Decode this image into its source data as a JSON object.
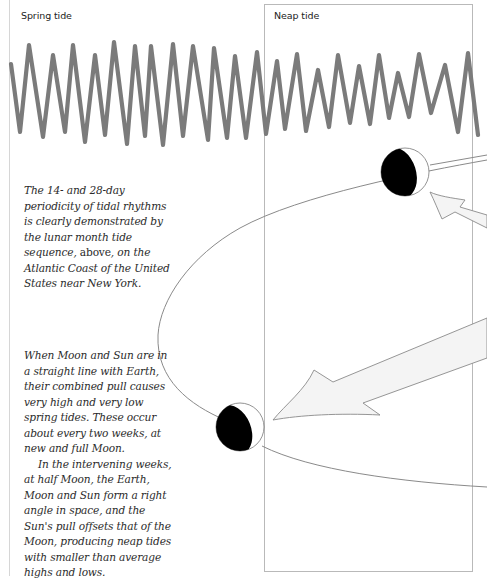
{
  "labels": {
    "spring_tide": "Spring tide",
    "neap_tide": "Neap tide"
  },
  "captions": {
    "periodicity": {
      "part1": "The 14- and 28-day periodicity of tidal rhythms is clearly demonstrated by the lunar month tide sequence, ",
      "emphasis": "above",
      "part2": ", on the Atlantic Coast of the United States near New York."
    },
    "spring_neap": {
      "paragraph1": "When Moon and Sun are in a straight line with Earth, their combined pull causes very high and very low spring tides. These occur about every two weeks, at new and full Moon.",
      "paragraph2": "In the intervening weeks, at half Moon, the Earth, Moon and Sun form a right angle in space, and the Sun's pull offsets that of the Moon, producing neap tides with smaller than average highs and lows."
    }
  },
  "colors": {
    "wave": "#7b7b7b",
    "box_border": "#b9b9b9",
    "orbit": "#8a8a8a",
    "moon_dark": "#000000",
    "arrow_fill": "#f4f4f4"
  },
  "chart_data": {
    "type": "line",
    "xlabel": "",
    "ylabel": "",
    "annotations": [
      "Spring tide",
      "Neap tide"
    ],
    "regions": [
      {
        "name": "Spring tide",
        "x_start": 0,
        "x_end": 0.52
      },
      {
        "name": "Neap tide",
        "x_start": 0.52,
        "x_end": 1.0
      }
    ],
    "grid": false,
    "points_px": [
      [
        11,
        64
      ],
      [
        20,
        132
      ],
      [
        29,
        45
      ],
      [
        43,
        137
      ],
      [
        53,
        55
      ],
      [
        65,
        132
      ],
      [
        73,
        45
      ],
      [
        85,
        142
      ],
      [
        95,
        55
      ],
      [
        105,
        135
      ],
      [
        114,
        42
      ],
      [
        127,
        144
      ],
      [
        135,
        46
      ],
      [
        145,
        136
      ],
      [
        151,
        46
      ],
      [
        163,
        145
      ],
      [
        173,
        44
      ],
      [
        183,
        136
      ],
      [
        193,
        46
      ],
      [
        208,
        140
      ],
      [
        214,
        48
      ],
      [
        227,
        138
      ],
      [
        235,
        56
      ],
      [
        246,
        138
      ],
      [
        257,
        52
      ],
      [
        266,
        134
      ],
      [
        277,
        61
      ],
      [
        285,
        129
      ],
      [
        297,
        54
      ],
      [
        306,
        131
      ],
      [
        318,
        70
      ],
      [
        329,
        127
      ],
      [
        338,
        55
      ],
      [
        350,
        123
      ],
      [
        359,
        66
      ],
      [
        370,
        124
      ],
      [
        379,
        55
      ],
      [
        389,
        118
      ],
      [
        398,
        73
      ],
      [
        409,
        117
      ],
      [
        419,
        54
      ],
      [
        431,
        113
      ],
      [
        445,
        65
      ],
      [
        458,
        132
      ],
      [
        468,
        53
      ],
      [
        478,
        135
      ]
    ],
    "tidal_range_relative": {
      "spring_peak_to_trough_px": [
        87,
        92,
        92,
        87,
        97,
        95,
        100,
        102,
        90,
        97,
        92,
        94,
        90,
        82,
        82
      ],
      "neap_peak_to_trough_px": [
        73,
        68,
        77,
        57,
        68,
        57,
        58,
        45,
        44,
        59,
        67,
        82
      ]
    }
  }
}
